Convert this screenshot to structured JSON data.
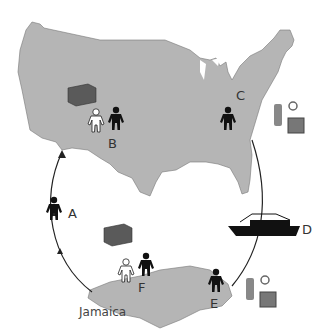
{
  "diagram": {
    "type": "cycle",
    "regions": [
      {
        "name": "United States",
        "label": ""
      },
      {
        "name": "Jamaica",
        "label": "Jamaica"
      }
    ],
    "nodes": [
      {
        "id": "A",
        "label": "A",
        "icons": [
          "person-black"
        ]
      },
      {
        "id": "B",
        "label": "B",
        "icons": [
          "money-stack",
          "person-white",
          "person-black"
        ]
      },
      {
        "id": "C",
        "label": "C",
        "icons": [
          "person-black",
          "watch",
          "ring",
          "television"
        ]
      },
      {
        "id": "D",
        "label": "D",
        "icons": [
          "ship"
        ]
      },
      {
        "id": "E",
        "label": "E",
        "icons": [
          "person-black",
          "watch",
          "ring",
          "television"
        ]
      },
      {
        "id": "F",
        "label": "F",
        "icons": [
          "money-stack",
          "person-white",
          "person-black"
        ]
      }
    ],
    "flow": [
      "F",
      "A",
      "B",
      "C",
      "D",
      "E",
      "F"
    ]
  },
  "labels": {
    "a": "A",
    "b": "B",
    "c": "C",
    "d": "D",
    "e": "E",
    "f": "F",
    "jamaica": "Jamaica"
  },
  "colors": {
    "land": "#b5b5b5",
    "money": "#5a5a5a",
    "figure_dark": "#111111",
    "figure_light": "#ffffff",
    "ship": "#111111",
    "circle": "#222222"
  }
}
